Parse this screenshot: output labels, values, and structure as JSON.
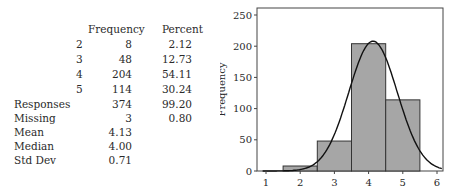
{
  "table": {
    "headers": {
      "frequency": "Frequency",
      "percent": "Percent"
    },
    "rows": [
      {
        "label": "",
        "value": "2",
        "frequency": "8",
        "percent": "2.12"
      },
      {
        "label": "",
        "value": "3",
        "frequency": "48",
        "percent": "12.73"
      },
      {
        "label": "",
        "value": "4",
        "frequency": "204",
        "percent": "54.11"
      },
      {
        "label": "",
        "value": "5",
        "frequency": "114",
        "percent": "30.24"
      },
      {
        "label": "Responses",
        "value": "",
        "frequency": "374",
        "percent": "99.20"
      },
      {
        "label": "Missing",
        "value": "",
        "frequency": "3",
        "percent": "0.80"
      },
      {
        "label": "Mean",
        "value": "",
        "frequency": "4.13",
        "percent": ""
      },
      {
        "label": "Median",
        "value": "",
        "frequency": "4.00",
        "percent": ""
      },
      {
        "label": "Std Dev",
        "value": "",
        "frequency": "0.71",
        "percent": ""
      }
    ]
  },
  "chart_data": {
    "type": "bar",
    "title": "",
    "xlabel": "",
    "ylabel": "Frequency",
    "categories": [
      "2",
      "3",
      "4",
      "5"
    ],
    "values": [
      8,
      48,
      204,
      114
    ],
    "bin_edges": [
      1.5,
      2.5,
      3.5,
      4.5,
      5.5
    ],
    "xticks": [
      "1",
      "2",
      "3",
      "4",
      "5",
      "6"
    ],
    "yticks": [
      "0",
      "50",
      "100",
      "150",
      "200",
      "250"
    ],
    "xlim": [
      0.75,
      6.25
    ],
    "ylim": [
      0,
      260
    ],
    "grid": false,
    "legend": null,
    "overlay": {
      "type": "normal_curve",
      "mean": 4.13,
      "sd": 0.71,
      "peak": 208
    },
    "bar_color": "#a6a6a6",
    "edge_color": "#333333"
  }
}
